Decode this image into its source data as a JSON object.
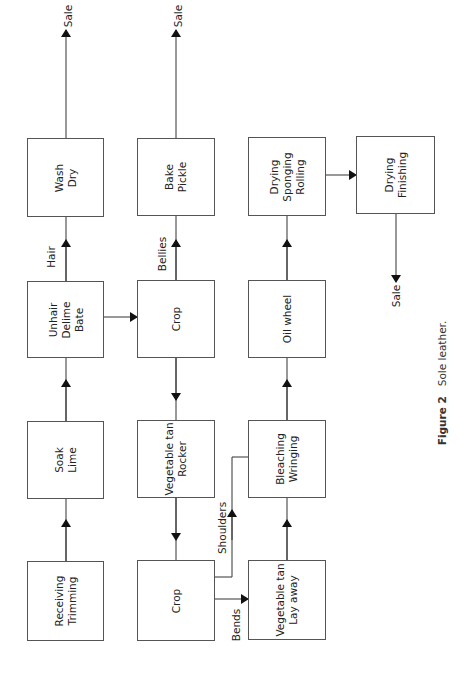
{
  "figure": {
    "number": "Figure 2",
    "title": "Sole leather."
  },
  "boxes": {
    "wash_dry": "Wash\nDry",
    "unhair_delime_bate": "Unhair\nDelime\nBate",
    "soak_lime": "Soak\nLime",
    "receiving_trimming": "Receiving\nTrimming",
    "bake_pickle": "Bake\nPickle",
    "crop_upper": "Crop",
    "vegetable_tan_rocker": "Vegetable tan\nRocker",
    "crop_lower": "Crop",
    "drying_sponging_rolling": "Drying\nSponging\nRolling",
    "oil_wheel": "Oil wheel",
    "bleaching_wringing": "Bleaching\nWringing",
    "vegetable_tan_lay_away": "Vegetable tan\nLay away",
    "drying_finishing": "Drying\nFinishing"
  },
  "flow_labels": {
    "sale_1": "Sale",
    "sale_2": "Sale",
    "sale_3": "Sale",
    "hair": "Hair",
    "bellies": "Bellies",
    "shoulders": "Shoulders",
    "bends": "Bends"
  }
}
